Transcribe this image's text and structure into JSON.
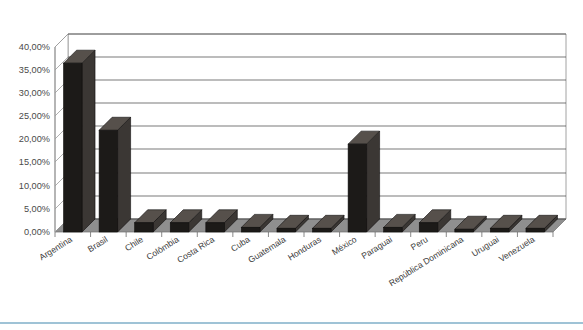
{
  "chart_data": {
    "type": "bar",
    "title": "",
    "subtitle": "",
    "xlabel": "",
    "ylabel": "",
    "categories": [
      "Argentina",
      "Brasil",
      "Chile",
      "Colômbia",
      "Costa Rica",
      "Cuba",
      "Guatemala",
      "Honduras",
      "México",
      "Paraguai",
      "Peru",
      "República Dominicana",
      "Uruguai",
      "Venezuela"
    ],
    "values": [
      36.5,
      22.0,
      2.0,
      2.0,
      2.0,
      1.0,
      0.8,
      0.8,
      19.0,
      1.0,
      2.0,
      0.6,
      0.8,
      0.8
    ],
    "ylim": [
      0,
      40
    ],
    "ytick_values": [
      0,
      5,
      10,
      15,
      20,
      25,
      30,
      35,
      40
    ],
    "ytick_labels": [
      "0,00%",
      "5,00%",
      "10,00%",
      "15,00%",
      "20,00%",
      "25,00%",
      "30,00%",
      "35,00%",
      "40,00%"
    ],
    "grid": true,
    "legend": "none",
    "style": "3d-column",
    "bar_color": "#1c1a18",
    "bar_side_color": "#3b3734",
    "bar_top_color": "#56504b",
    "plot_area_color": "#ffffff",
    "floor_color": "#8f8f8f",
    "gridline_color": "#3f3f3f",
    "axis_color": "#9a9a9a",
    "accent_rule_color": "#9fc3d6"
  }
}
